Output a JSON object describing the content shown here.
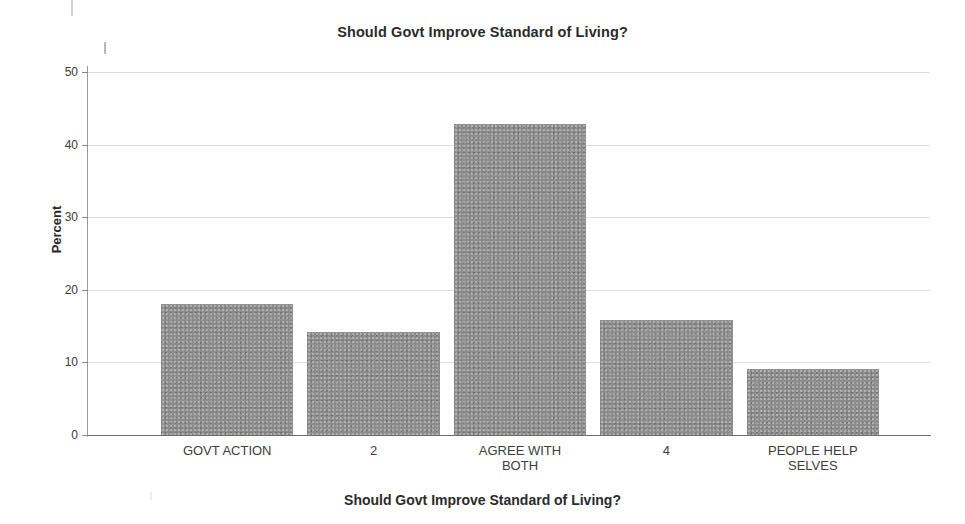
{
  "chart_data": {
    "type": "bar",
    "title": "Should Govt Improve Standard of Living?",
    "xlabel": "Should Govt Improve Standard of Living?",
    "ylabel": "Percent",
    "categories": [
      "GOVT ACTION",
      "2",
      "AGREE WITH\nBOTH",
      "4",
      "PEOPLE HELP\nSELVES"
    ],
    "values": [
      18.0,
      14.2,
      42.8,
      15.8,
      9.1
    ],
    "ylim": [
      0,
      50
    ],
    "yticks": [
      0,
      10,
      20,
      30,
      40,
      50
    ],
    "ytick_labels": [
      "0",
      "10",
      "20",
      "30",
      "40",
      "50"
    ],
    "grid": true,
    "legend": false,
    "bar_color": "#8b8b8b",
    "gridline_color": "#dcdcdc",
    "axis_color": "#6e6e6e"
  }
}
